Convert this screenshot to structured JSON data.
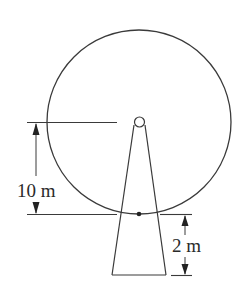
{
  "diagram": {
    "type": "ferris-wheel-geometry",
    "labels": {
      "hub_to_bottom_height": "10 m",
      "bottom_to_ground_height": "2 m"
    },
    "colors": {
      "stroke": "#3a3a3a",
      "background": "#ffffff"
    },
    "elements": [
      "wheel-circle",
      "hub-circle",
      "support-tower",
      "lowest-point-dot",
      "dimension-10m",
      "dimension-2m"
    ]
  }
}
